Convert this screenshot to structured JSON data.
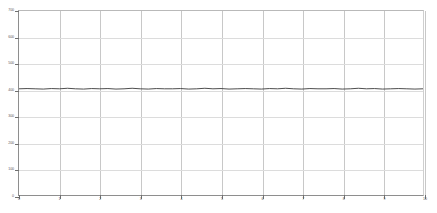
{
  "chart_data": {
    "type": "line",
    "title": "",
    "subtitle": "",
    "xlabel": "",
    "ylabel": "",
    "grid": true,
    "legend": false,
    "legend_position": "none",
    "line_color": "#3a3a3a",
    "grid_color": "#c8c8c8",
    "axis_color": "#8e8e8e",
    "background": "#ffffff",
    "xlim": [
      0,
      10
    ],
    "ylim": [
      0,
      700
    ],
    "xticks": [
      0,
      1,
      2,
      3,
      4,
      5,
      6,
      7,
      8,
      9,
      10
    ],
    "xticklabels": [
      "0",
      "1",
      "2",
      "3",
      "4",
      "5",
      "6",
      "7",
      "8",
      "9",
      "10"
    ],
    "yticks": [
      0,
      100,
      200,
      300,
      400,
      500,
      600,
      700
    ],
    "yticklabels": [
      "0",
      "100",
      "200",
      "300",
      "400",
      "500",
      "600",
      "700"
    ],
    "series": [
      {
        "name": "signal",
        "color": "#3a3a3a",
        "x": [
          0.0,
          0.2,
          0.4,
          0.6,
          0.8,
          1.0,
          1.2,
          1.4,
          1.6,
          1.8,
          2.0,
          2.2,
          2.4,
          2.6,
          2.8,
          3.0,
          3.2,
          3.4,
          3.6,
          3.8,
          4.0,
          4.2,
          4.4,
          4.6,
          4.8,
          5.0,
          5.2,
          5.4,
          5.6,
          5.8,
          6.0,
          6.2,
          6.4,
          6.6,
          6.8,
          7.0,
          7.2,
          7.4,
          7.6,
          7.8,
          8.0,
          8.2,
          8.4,
          8.6,
          8.8,
          9.0,
          9.2,
          9.4,
          9.6,
          9.8,
          10.0
        ],
        "values": [
          404,
          405,
          404,
          403,
          405,
          404,
          406,
          404,
          403,
          405,
          404,
          405,
          403,
          404,
          406,
          404,
          403,
          405,
          404,
          404,
          405,
          403,
          404,
          406,
          404,
          405,
          403,
          404,
          405,
          404,
          403,
          405,
          404,
          406,
          404,
          403,
          405,
          404,
          404,
          405,
          403,
          404,
          406,
          404,
          405,
          403,
          404,
          405,
          404,
          403,
          404
        ]
      }
    ]
  }
}
